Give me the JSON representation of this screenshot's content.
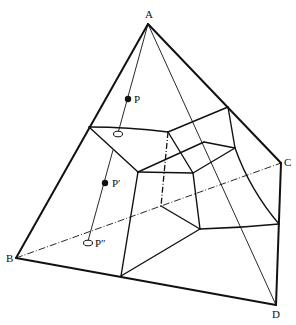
{
  "diagram": {
    "type": "tetrahedron-projection",
    "vertices": [
      {
        "label": "A",
        "x": 148,
        "y": 24,
        "lx": 145,
        "ly": 18
      },
      {
        "label": "B",
        "x": 16,
        "y": 258,
        "lx": 7,
        "ly": 262
      },
      {
        "label": "C",
        "x": 281,
        "y": 163,
        "lx": 284,
        "ly": 166
      },
      {
        "label": "D",
        "x": 276,
        "y": 305,
        "lx": 273,
        "ly": 318
      }
    ],
    "points": [
      {
        "label": "P",
        "x": 128,
        "y": 99,
        "style": "filled",
        "lx": 134,
        "ly": 103
      },
      {
        "label": "P′",
        "x": 105,
        "y": 183,
        "style": "filled",
        "lx": 112,
        "ly": 187
      },
      {
        "label": "P″",
        "x": 88,
        "y": 243,
        "style": "open",
        "lx": 95,
        "ly": 247
      },
      {
        "label": "",
        "x": 118,
        "y": 134,
        "style": "open"
      }
    ]
  }
}
